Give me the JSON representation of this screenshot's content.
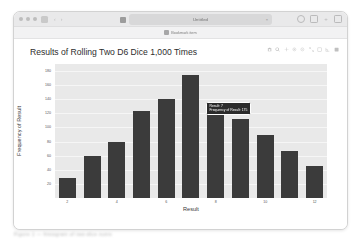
{
  "browser": {
    "tab": {
      "title": "Untitled",
      "close_label": "×",
      "favicon": "page-icon"
    },
    "nav": {
      "back": "‹",
      "forward": "›",
      "sidebar_icon": "sidebar-icon"
    },
    "traffic_lights": [
      "close",
      "minimize",
      "zoom"
    ],
    "toolbar_right": [
      "share-icon",
      "new-tab-icon",
      "plus-icon",
      "tabs-icon"
    ],
    "bookmark": {
      "label": "Bookmark item",
      "favicon": "bookmark-favicon"
    }
  },
  "modebar": {
    "buttons": [
      "camera-icon",
      "zoom-icon",
      "pan-icon",
      "zoom-in-icon",
      "zoom-out-icon",
      "autoscale-icon",
      "reset-axes-icon",
      "spike-lines-icon",
      "plotly-logo-icon"
    ]
  },
  "tooltip": {
    "line1": "Result: 7",
    "line2": "Frequency of Result: 175"
  },
  "caption": {
    "text": "Figure 1 — histogram of two-dice sums"
  },
  "colors": {
    "bar": "#3b3b3b",
    "plot_background": "#e9e9e9",
    "gridline": "#f6f6f6",
    "tooltip_background": "#2b2b2b"
  },
  "chart_data": {
    "type": "bar",
    "title": "Results of Rolling Two D6 Dice 1,000 Times",
    "xlabel": "Result",
    "ylabel": "Frequency of Result",
    "categories": [
      2,
      3,
      4,
      5,
      6,
      7,
      8,
      9,
      10,
      11,
      12
    ],
    "values": [
      28,
      60,
      80,
      123,
      140,
      175,
      130,
      112,
      90,
      67,
      45
    ],
    "xticks": [
      2,
      4,
      6,
      8,
      10,
      12
    ],
    "yticks": [
      20,
      40,
      60,
      80,
      100,
      120,
      140,
      160,
      180
    ],
    "ylim": [
      0,
      190
    ],
    "grid": true,
    "legend": false
  }
}
